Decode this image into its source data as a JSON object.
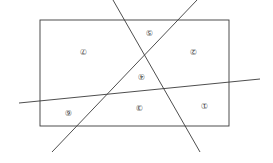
{
  "diagram": {
    "orientation": "rotated 180 degrees",
    "rectangle": {
      "x": 40,
      "y": 20,
      "width": 189,
      "height": 106
    },
    "lines": [
      {
        "name": "line-a",
        "x1": 113,
        "y1": 0,
        "x2": 200,
        "y2": 152
      },
      {
        "name": "line-b",
        "x1": 197,
        "y1": 0,
        "x2": 52,
        "y2": 152
      },
      {
        "name": "line-c",
        "x1": 19,
        "y1": 103,
        "x2": 260,
        "y2": 79
      }
    ],
    "regions": [
      {
        "label": "⑦",
        "x": 83,
        "y": 51
      },
      {
        "label": "⑤",
        "x": 149,
        "y": 32
      },
      {
        "label": "②",
        "x": 193,
        "y": 51
      },
      {
        "label": "④",
        "x": 141,
        "y": 76
      },
      {
        "label": "③",
        "x": 139,
        "y": 107
      },
      {
        "label": "①",
        "x": 204,
        "y": 105
      },
      {
        "label": "⑥",
        "x": 68,
        "y": 112
      }
    ]
  }
}
